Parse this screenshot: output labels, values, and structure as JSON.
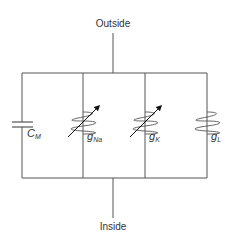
{
  "diagram": {
    "terminals": {
      "top": "Outside",
      "bottom": "Inside"
    },
    "components": [
      {
        "id": "capacitor",
        "type": "capacitor",
        "symbol": "C",
        "subscript": "M"
      },
      {
        "id": "sodium-conductance",
        "type": "variable-conductance",
        "symbol": "g",
        "subscript": "Na"
      },
      {
        "id": "potassium-conductance",
        "type": "variable-conductance",
        "symbol": "g",
        "subscript": "K"
      },
      {
        "id": "leak-conductance",
        "type": "fixed-conductance",
        "symbol": "g",
        "subscript": "L"
      }
    ],
    "colors": {
      "line": "#555555",
      "text": "#333333",
      "arrow": "#111111",
      "background": "#ffffff"
    }
  }
}
